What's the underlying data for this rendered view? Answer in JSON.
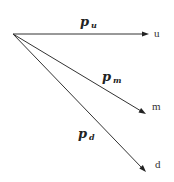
{
  "diagram": {
    "type": "branching-tree",
    "origin": {
      "x": 13,
      "y": 34
    },
    "branches": [
      {
        "id": "up",
        "end": {
          "x": 148,
          "y": 34
        },
        "probability_symbol": "p",
        "probability_subscript": "u",
        "label_pos": {
          "x": 80,
          "y": 26
        },
        "node_label": "u",
        "node_label_pos": {
          "x": 154,
          "y": 37
        }
      },
      {
        "id": "middle",
        "end": {
          "x": 145,
          "y": 113
        },
        "probability_symbol": "p",
        "probability_subscript": "m",
        "label_pos": {
          "x": 102,
          "y": 81
        },
        "node_label": "m",
        "node_label_pos": {
          "x": 152,
          "y": 110
        }
      },
      {
        "id": "down",
        "end": {
          "x": 145,
          "y": 171
        },
        "probability_symbol": "p",
        "probability_subscript": "d",
        "label_pos": {
          "x": 78,
          "y": 138
        },
        "node_label": "d",
        "node_label_pos": {
          "x": 155,
          "y": 168
        }
      }
    ],
    "colors": {
      "line": "#333333",
      "text": "#222222",
      "background": "#ffffff"
    }
  }
}
